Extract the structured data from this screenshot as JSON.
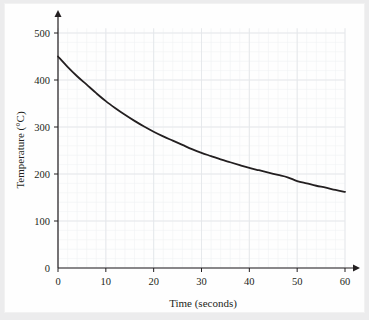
{
  "figure": {
    "background_color": "#ececed",
    "plate_color": "#fefefe",
    "axis_color": "#231f20",
    "curve_color": "#231f20",
    "grid_major_color": "#e4e6ea",
    "grid_minor_color": "#f0f1f4"
  },
  "chart_data": {
    "type": "line",
    "title": "",
    "subtitle": "",
    "xlabel": "Time (seconds)",
    "ylabel": "Temperature (°C)",
    "xlim": [
      0,
      62
    ],
    "ylim": [
      0,
      520
    ],
    "xticks": [
      0,
      10,
      20,
      30,
      40,
      50,
      60
    ],
    "xtick_labels": [
      "0",
      "10",
      "20",
      "30",
      "40",
      "50",
      "60"
    ],
    "yticks": [
      0,
      100,
      200,
      300,
      400,
      500
    ],
    "ytick_labels": [
      "0",
      "100",
      "200",
      "300",
      "400",
      "500"
    ],
    "grid": true,
    "grid_minor": true,
    "grid_minor_step_x": 2,
    "grid_minor_step_y": 20,
    "legend": false,
    "legend_position": "none",
    "axis_arrows": [
      "x-right",
      "y-up"
    ],
    "series": [
      {
        "name": "Cooling curve",
        "color": "#231f20",
        "line_width": 1.8,
        "x": [
          0,
          2,
          4,
          6,
          8,
          10,
          12,
          14,
          16,
          18,
          20,
          22,
          24,
          26,
          28,
          30,
          32,
          34,
          36,
          38,
          40,
          42,
          44,
          46,
          48,
          50,
          52,
          54,
          56,
          58,
          60
        ],
        "y": [
          450,
          428,
          408,
          390,
          372,
          355,
          340,
          326,
          313,
          301,
          290,
          280,
          271,
          262,
          253,
          245,
          238,
          231,
          225,
          219,
          213,
          208,
          203,
          198,
          193,
          185,
          180,
          175,
          171,
          166,
          162
        ]
      }
    ],
    "annotations": [],
    "keypoints": {
      "t0": 450,
      "t10": 355,
      "t20": 290,
      "t30": 245,
      "t40": 213,
      "t50": 185,
      "t60": 162
    }
  }
}
